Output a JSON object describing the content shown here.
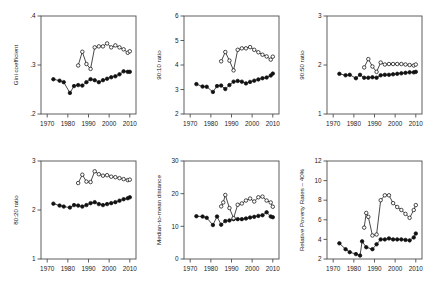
{
  "figure": {
    "type": "multi-panel-line-chart",
    "panels": 6,
    "layout": "3 columns x 2 rows",
    "series_legend": {
      "filled_circle": "series A (solid markers, full period)",
      "hollow_circle": "series B (open markers, begins mid-1980s)"
    }
  },
  "axis_common": {
    "xlabel": "",
    "xticks": [
      1970,
      1980,
      1990,
      2000,
      2010
    ],
    "xtick_labels": [
      "1970",
      "1980",
      "1990",
      "2000",
      "2010"
    ],
    "xlim": [
      1967,
      2013
    ]
  },
  "chart_data": [
    {
      "type": "line",
      "id": "gini",
      "title": "",
      "ylabel": "Gini coefficient",
      "xlabel": "",
      "xlim": [
        1967,
        2013
      ],
      "ylim": [
        0.2,
        0.4
      ],
      "yticks": [
        0.2,
        0.3,
        0.4
      ],
      "ytick_labels": [
        ".2",
        ".3",
        ".4"
      ],
      "xticks": [
        1970,
        1980,
        1990,
        2000,
        2010
      ],
      "xtick_labels": [
        "1970",
        "1980",
        "1990",
        "2000",
        "2010"
      ],
      "grid": false,
      "legend": "none",
      "series": [
        {
          "name": "filled",
          "marker": "filled-circle",
          "x": [
            1973,
            1976,
            1978,
            1981,
            1983,
            1985,
            1987,
            1989,
            1991,
            1993,
            1995,
            1997,
            1999,
            2001,
            2003,
            2005,
            2007,
            2009,
            2010
          ],
          "values": [
            0.271,
            0.268,
            0.265,
            0.243,
            0.257,
            0.259,
            0.258,
            0.265,
            0.271,
            0.269,
            0.265,
            0.269,
            0.272,
            0.275,
            0.277,
            0.281,
            0.287,
            0.286,
            0.286
          ]
        },
        {
          "name": "hollow",
          "marker": "open-circle",
          "x": [
            1985,
            1987,
            1989,
            1991,
            1993,
            1995,
            1997,
            1999,
            2001,
            2003,
            2005,
            2007,
            2009,
            2010
          ],
          "values": [
            0.299,
            0.327,
            0.302,
            0.292,
            0.336,
            0.338,
            0.338,
            0.344,
            0.336,
            0.34,
            0.336,
            0.332,
            0.325,
            0.328
          ]
        }
      ]
    },
    {
      "type": "line",
      "id": "p90p10",
      "title": "",
      "ylabel": "90:10 ratio",
      "xlabel": "",
      "xlim": [
        1967,
        2013
      ],
      "ylim": [
        2,
        6
      ],
      "yticks": [
        2,
        3,
        4,
        5,
        6
      ],
      "ytick_labels": [
        "2",
        "3",
        "4",
        "5",
        "6"
      ],
      "xticks": [
        1970,
        1980,
        1990,
        2000,
        2010
      ],
      "xtick_labels": [
        "1970",
        "1980",
        "1990",
        "2000",
        "2010"
      ],
      "grid": false,
      "legend": "none",
      "series": [
        {
          "name": "filled",
          "marker": "filled-circle",
          "x": [
            1973,
            1976,
            1978,
            1981,
            1983,
            1985,
            1987,
            1989,
            1991,
            1993,
            1995,
            1997,
            1999,
            2001,
            2003,
            2005,
            2007,
            2009,
            2010
          ],
          "values": [
            3.22,
            3.12,
            3.11,
            2.9,
            3.14,
            3.16,
            3.02,
            3.18,
            3.32,
            3.35,
            3.32,
            3.25,
            3.31,
            3.36,
            3.41,
            3.46,
            3.49,
            3.57,
            3.65
          ]
        },
        {
          "name": "hollow",
          "marker": "open-circle",
          "x": [
            1985,
            1987,
            1989,
            1991,
            1993,
            1995,
            1997,
            1999,
            2001,
            2003,
            2005,
            2007,
            2009,
            2010
          ],
          "values": [
            4.15,
            4.53,
            4.18,
            3.78,
            4.62,
            4.68,
            4.68,
            4.73,
            4.62,
            4.52,
            4.42,
            4.35,
            4.22,
            4.34
          ]
        }
      ]
    },
    {
      "type": "line",
      "id": "p90p50",
      "title": "",
      "ylabel": "90:50 ratio",
      "xlabel": "",
      "xlim": [
        1967,
        2013
      ],
      "ylim": [
        1,
        3
      ],
      "yticks": [
        1,
        2,
        3
      ],
      "ytick_labels": [
        "1",
        "2",
        "3"
      ],
      "xticks": [
        1970,
        1980,
        1990,
        2000,
        2010
      ],
      "xtick_labels": [
        "1970",
        "1980",
        "1990",
        "2000",
        "2010"
      ],
      "grid": false,
      "legend": "none",
      "series": [
        {
          "name": "filled",
          "marker": "filled-circle",
          "x": [
            1973,
            1976,
            1978,
            1981,
            1983,
            1985,
            1987,
            1989,
            1991,
            1993,
            1995,
            1997,
            1999,
            2001,
            2003,
            2005,
            2007,
            2009,
            2010
          ],
          "values": [
            1.82,
            1.79,
            1.8,
            1.73,
            1.8,
            1.74,
            1.74,
            1.75,
            1.74,
            1.79,
            1.8,
            1.8,
            1.81,
            1.82,
            1.83,
            1.84,
            1.85,
            1.85,
            1.86
          ]
        },
        {
          "name": "hollow",
          "marker": "open-circle",
          "x": [
            1985,
            1987,
            1989,
            1991,
            1993,
            1995,
            1997,
            1999,
            2001,
            2003,
            2005,
            2007,
            2009,
            2010
          ],
          "values": [
            1.95,
            2.12,
            1.97,
            1.86,
            2.05,
            2.01,
            2.02,
            2.02,
            2.02,
            2.02,
            2.01,
            2.0,
            1.99,
            2.01
          ]
        }
      ]
    },
    {
      "type": "line",
      "id": "p80p20",
      "title": "",
      "ylabel": "80:20 ratio",
      "xlabel": "",
      "xlim": [
        1967,
        2013
      ],
      "ylim": [
        1,
        3
      ],
      "yticks": [
        1,
        2,
        3
      ],
      "ytick_labels": [
        "1",
        "2",
        "3"
      ],
      "xticks": [
        1970,
        1980,
        1990,
        2000,
        2010
      ],
      "xtick_labels": [
        "1970",
        "1980",
        "1990",
        "2000",
        "2010"
      ],
      "grid": false,
      "legend": "none",
      "series": [
        {
          "name": "filled",
          "marker": "filled-circle",
          "x": [
            1973,
            1976,
            1978,
            1981,
            1983,
            1985,
            1987,
            1989,
            1991,
            1993,
            1995,
            1997,
            1999,
            2001,
            2003,
            2005,
            2007,
            2009,
            2010
          ],
          "values": [
            2.13,
            2.09,
            2.07,
            2.05,
            2.1,
            2.09,
            2.07,
            2.1,
            2.14,
            2.16,
            2.12,
            2.1,
            2.12,
            2.14,
            2.16,
            2.19,
            2.22,
            2.24,
            2.26
          ]
        },
        {
          "name": "hollow",
          "marker": "open-circle",
          "x": [
            1985,
            1987,
            1989,
            1991,
            1993,
            1995,
            1997,
            1999,
            2001,
            2003,
            2005,
            2007,
            2009,
            2010
          ],
          "values": [
            2.55,
            2.72,
            2.58,
            2.57,
            2.79,
            2.73,
            2.7,
            2.71,
            2.68,
            2.67,
            2.65,
            2.63,
            2.61,
            2.62
          ]
        }
      ]
    },
    {
      "type": "line",
      "id": "median-to-mean",
      "title": "",
      "ylabel": "Median-to-mean distance",
      "xlabel": "",
      "xlim": [
        1967,
        2013
      ],
      "ylim": [
        0,
        30
      ],
      "yticks": [
        0,
        10,
        20,
        30
      ],
      "ytick_labels": [
        "0",
        "10",
        "20",
        "30"
      ],
      "xticks": [
        1970,
        1980,
        1990,
        2000,
        2010
      ],
      "xtick_labels": [
        "1970",
        "1980",
        "1990",
        "2000",
        "2010"
      ],
      "grid": false,
      "legend": "none",
      "series": [
        {
          "name": "filled",
          "marker": "filled-circle",
          "x": [
            1973,
            1976,
            1978,
            1981,
            1983,
            1985,
            1987,
            1989,
            1991,
            1993,
            1995,
            1997,
            1999,
            2001,
            2003,
            2005,
            2007,
            2009,
            2010
          ],
          "values": [
            13.1,
            13.0,
            12.6,
            10.4,
            13.0,
            10.5,
            11.6,
            11.8,
            12.2,
            12.2,
            12.2,
            12.4,
            12.7,
            12.9,
            13.2,
            13.4,
            14.3,
            13.0,
            12.8
          ]
        },
        {
          "name": "hollow",
          "marker": "open-circle",
          "x": [
            1985,
            1986,
            1987,
            1989,
            1991,
            1993,
            1995,
            1997,
            1999,
            2001,
            2003,
            2005,
            2007,
            2009,
            2010
          ],
          "values": [
            16.1,
            17.3,
            19.6,
            15.6,
            12.5,
            16.6,
            17.0,
            17.9,
            18.5,
            17.6,
            18.9,
            19.1,
            17.9,
            17.3,
            16.0
          ]
        }
      ]
    },
    {
      "type": "line",
      "id": "relative-poverty-40",
      "title": "",
      "ylabel": "Relative Poverty Rates – 40%",
      "xlabel": "",
      "xlim": [
        1967,
        2013
      ],
      "ylim": [
        2,
        12
      ],
      "yticks": [
        2,
        4,
        6,
        8,
        10,
        12
      ],
      "ytick_labels": [
        "2",
        "4",
        "6",
        "8",
        "10",
        "12"
      ],
      "xticks": [
        1970,
        1980,
        1990,
        2000,
        2010
      ],
      "xtick_labels": [
        "1970",
        "1980",
        "1990",
        "2000",
        "2010"
      ],
      "grid": false,
      "legend": "none",
      "series": [
        {
          "name": "filled",
          "marker": "filled-circle",
          "x": [
            1973,
            1976,
            1978,
            1981,
            1983,
            1984,
            1986,
            1989,
            1991,
            1993,
            1995,
            1997,
            1999,
            2001,
            2003,
            2005,
            2007,
            2009,
            2010
          ],
          "values": [
            3.6,
            3.0,
            2.7,
            2.5,
            2.35,
            3.8,
            3.2,
            3.0,
            3.5,
            4.0,
            4.0,
            4.1,
            4.0,
            4.0,
            4.0,
            3.95,
            3.9,
            4.2,
            4.6
          ]
        },
        {
          "name": "hollow",
          "marker": "open-circle",
          "x": [
            1985,
            1986,
            1987,
            1989,
            1991,
            1993,
            1995,
            1997,
            1999,
            2001,
            2003,
            2005,
            2007,
            2009,
            2010
          ],
          "values": [
            5.2,
            6.7,
            6.3,
            4.4,
            4.5,
            8.0,
            8.5,
            8.5,
            7.7,
            7.3,
            7.0,
            6.6,
            6.2,
            7.0,
            7.5
          ]
        }
      ]
    }
  ]
}
